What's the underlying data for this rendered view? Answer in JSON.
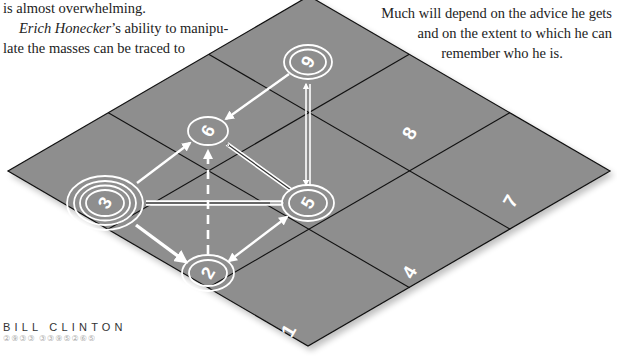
{
  "text": {
    "left_para": {
      "line1": "is almost overwhelming.",
      "line2_name": "Erich Honecker",
      "line2_rest": "’s ability to manipu-",
      "line3": "late the masses can be traced to"
    },
    "right_para": {
      "line1": "Much will depend on the advice he gets",
      "line2": "and on the extent to which he can",
      "line3": "remember who he is."
    }
  },
  "caption": {
    "name": "BILL CLINTON",
    "code": "②⑨③③  ③③⑨⑤②⑥⑤"
  },
  "board": {
    "fill": "#8e8e8e",
    "line_color": "#111111",
    "cells": [
      "1",
      "2",
      "3",
      "4",
      "5",
      "6",
      "7",
      "8",
      "9"
    ],
    "plain_cell_labels": {
      "c1": "1",
      "c4": "4",
      "c7": "7",
      "c8": "8"
    },
    "nodes": {
      "n9": {
        "label": "9",
        "rings": 2
      },
      "n6": {
        "label": "6",
        "rings": 1
      },
      "n3": {
        "label": "3",
        "rings": 4
      },
      "n5": {
        "label": "5",
        "rings": 2
      },
      "n2": {
        "label": "2",
        "rings": 2
      }
    },
    "edges": [
      {
        "from": "9",
        "to": "6",
        "style": "arrow"
      },
      {
        "from": "9",
        "to": "5",
        "style": "double-arrow-both"
      },
      {
        "from": "3",
        "to": "6",
        "style": "arrow"
      },
      {
        "from": "3",
        "to": "5",
        "style": "double-line-arrow"
      },
      {
        "from": "3",
        "to": "2",
        "style": "thick-arrow"
      },
      {
        "from": "5",
        "to": "6",
        "style": "outline-arrow"
      },
      {
        "from": "2",
        "to": "6",
        "style": "dashed-arrow"
      },
      {
        "from": "2",
        "to": "5",
        "style": "arrow-both"
      }
    ]
  }
}
